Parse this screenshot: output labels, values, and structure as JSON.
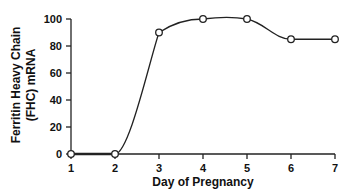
{
  "chart_data": {
    "type": "line",
    "title": "",
    "xlabel": "Day of Pregnancy",
    "ylabel_lines": [
      "Ferritin Heavy Chain",
      "(FHC) mRNA"
    ],
    "ylabel": "Ferritin Heavy Chain (FHC) mRNA",
    "x": [
      1,
      2,
      3,
      4,
      5,
      6,
      7
    ],
    "x_ticks": [
      "1",
      "2",
      "3",
      "4",
      "5",
      "6",
      "7"
    ],
    "y_ticks": [
      "0",
      "20",
      "40",
      "60",
      "80",
      "100"
    ],
    "ylim": [
      0,
      100
    ],
    "xlim": [
      1,
      7
    ],
    "grid": false,
    "series": [
      {
        "name": "FHC mRNA",
        "values": [
          0,
          0,
          90,
          100,
          100,
          85,
          85
        ],
        "marker": "open-circle",
        "color": "#222222"
      }
    ]
  }
}
